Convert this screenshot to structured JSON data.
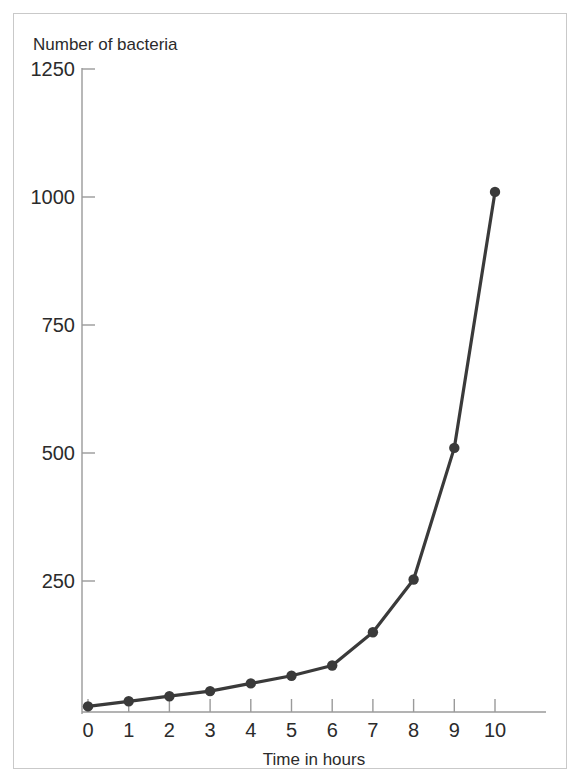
{
  "figure": {
    "background_color": "#ffffff",
    "frame_color": "#c9c9c9",
    "series_color": "#3a3a3a",
    "axis_color": "#9a9a9a",
    "text_color": "#2b2b2b"
  },
  "chart_data": {
    "type": "line",
    "title": "",
    "ylabel": "Number of bacteria",
    "xlabel": "Time in hours",
    "x": [
      0,
      1,
      2,
      3,
      4,
      5,
      6,
      7,
      8,
      9,
      10
    ],
    "values": [
      5,
      15,
      25,
      35,
      50,
      65,
      85,
      150,
      253,
      510,
      1010
    ],
    "series": [
      {
        "name": "Number of bacteria",
        "values": [
          5,
          15,
          25,
          35,
          50,
          65,
          85,
          150,
          253,
          510,
          1010
        ]
      }
    ],
    "xlim": [
      0,
      10.6
    ],
    "ylim": [
      0,
      1250
    ],
    "xticks": [
      0,
      1,
      2,
      3,
      4,
      5,
      6,
      7,
      8,
      9,
      10
    ],
    "xtick_labels": [
      "0",
      "1",
      "2",
      "3",
      "4",
      "5",
      "6",
      "7",
      "8",
      "9",
      "10"
    ],
    "yticks": [
      250,
      500,
      750,
      1000,
      1250
    ],
    "ytick_labels": [
      "250",
      "500",
      "750",
      "1000",
      "1250"
    ],
    "grid": false,
    "legend": null,
    "markers": "filled-circle"
  }
}
